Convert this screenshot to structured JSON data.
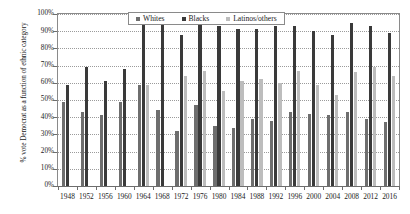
{
  "chart_data": {
    "type": "bar",
    "title": "",
    "xlabel": "",
    "ylabel": "% vote Democrat as a function of ethnic category",
    "ylim": [
      0,
      100
    ],
    "ytick_labels": [
      "0%",
      "10%",
      "20%",
      "30%",
      "40%",
      "50%",
      "60%",
      "70%",
      "80%",
      "90%",
      "100%"
    ],
    "ytick_values": [
      0,
      10,
      20,
      30,
      40,
      50,
      60,
      70,
      80,
      90,
      100
    ],
    "grid": true,
    "legend_position": "top-center",
    "categories": [
      "1948",
      "1952",
      "1956",
      "1960",
      "1964",
      "1968",
      "1972",
      "1976",
      "1980",
      "1984",
      "1988",
      "1992",
      "1996",
      "2000",
      "2004",
      "2008",
      "2012",
      "2016"
    ],
    "series": [
      {
        "name": "Whites",
        "color": "#6e6e6e",
        "values": [
          49,
          43,
          41,
          49,
          59,
          44,
          32,
          47,
          35,
          34,
          39,
          38,
          43,
          42,
          41,
          43,
          39,
          37
        ]
      },
      {
        "name": "Blacks",
        "color": "#3a3a3a",
        "values": [
          59,
          69,
          61,
          68,
          94,
          97,
          88,
          95,
          93,
          91,
          91,
          93,
          93,
          90,
          88,
          95,
          93,
          89
        ]
      },
      {
        "name": "Latinos/others",
        "color": "#bdbdbd",
        "values": [
          null,
          null,
          null,
          null,
          59,
          null,
          64,
          67,
          55,
          61,
          62,
          60,
          67,
          59,
          53,
          66,
          69,
          64
        ]
      }
    ]
  },
  "legend": {
    "items": [
      {
        "label": "Whites",
        "key": "whites"
      },
      {
        "label": "Blacks",
        "key": "blacks"
      },
      {
        "label": "Latinos/others",
        "key": "latinos"
      }
    ]
  }
}
